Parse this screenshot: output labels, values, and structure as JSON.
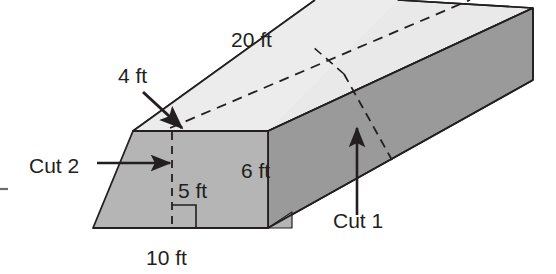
{
  "figure": {
    "type": "geometry-diagram",
    "canvas": {
      "width": 556,
      "height": 274
    },
    "colors": {
      "background": "#ffffff",
      "top_face": "#e9e9e9",
      "front_trapezoid_face": "#b5b5b5",
      "right_slant_face": "#9a9a9a",
      "far_end_face": "#a0a0a0",
      "outline": "#231f20",
      "label_text": "#231f20"
    },
    "labels": {
      "length": "20 ft",
      "top_width": "4 ft",
      "slant_height": "6 ft",
      "height": "5 ft",
      "base_width": "10 ft",
      "cut_one": "Cut 1",
      "cut_two": "Cut 2"
    },
    "annotations": [
      {
        "name": "length-label",
        "text": "20 ft",
        "x": 231,
        "y": 47
      },
      {
        "name": "top-width-label",
        "text": "4 ft",
        "x": 118,
        "y": 83
      },
      {
        "name": "slant-height-label",
        "text": "6 ft",
        "x": 241,
        "y": 178
      },
      {
        "name": "height-label",
        "text": "5 ft",
        "x": 178,
        "y": 198
      },
      {
        "name": "base-width-label",
        "text": "10 ft",
        "x": 146,
        "y": 265
      },
      {
        "name": "cut-one-label",
        "text": "Cut 1",
        "x": 333,
        "y": 228
      },
      {
        "name": "cut-two-label",
        "text": "Cut 2",
        "x": 29,
        "y": 173
      }
    ]
  }
}
